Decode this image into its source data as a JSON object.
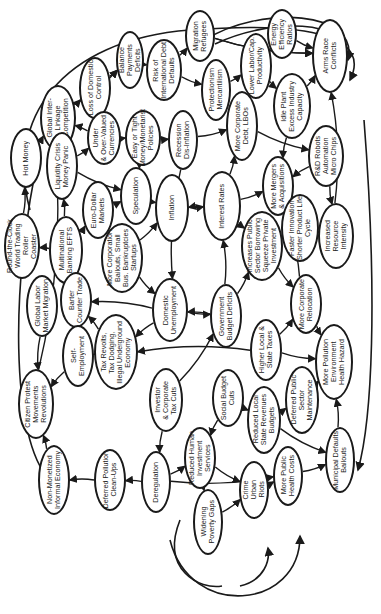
{
  "diagram": {
    "orientation": "rotated 90deg counter-clockwise (labels read bottom-to-top)",
    "colors": {
      "stroke": "#1a1a1a",
      "background": "#ffffff"
    },
    "nodes": [
      {
        "id": "n0",
        "label": "Global Inter-\nLinkage\nCompetition",
        "x": 58,
        "y": 118,
        "w": 36,
        "h": 66
      },
      {
        "id": "n1",
        "label": "Loss of Domestic\nControl",
        "x": 95,
        "y": 88,
        "w": 32,
        "h": 62
      },
      {
        "id": "n2",
        "label": "Balance\nPayments Deficits",
        "x": 130,
        "y": 60,
        "w": 28,
        "h": 58
      },
      {
        "id": "n3",
        "label": "Risk of\nInternational Debt\nDefaults",
        "x": 164,
        "y": 70,
        "w": 36,
        "h": 62
      },
      {
        "id": "n4",
        "label": "Migration\nRefugees",
        "x": 200,
        "y": 36,
        "w": 30,
        "h": 52
      },
      {
        "id": "n5",
        "label": "Protectionism\nMercantilism",
        "x": 216,
        "y": 90,
        "w": 30,
        "h": 62
      },
      {
        "id": "n6",
        "label": "Lower Labor/Cap.\nProductivity",
        "x": 256,
        "y": 66,
        "w": 32,
        "h": 66
      },
      {
        "id": "n7",
        "label": "Energy\nEfficiency\nRatios",
        "x": 282,
        "y": 34,
        "w": 30,
        "h": 50
      },
      {
        "id": "n8",
        "label": "Arms Race\nConflicts",
        "x": 330,
        "y": 56,
        "w": 36,
        "h": 74
      },
      {
        "id": "n9",
        "label": "Idle Plant\nExcess Industry\nCapacity",
        "x": 292,
        "y": 106,
        "w": 38,
        "h": 66
      },
      {
        "id": "n10",
        "label": "Under\n& Over-Valued\nCurrencies",
        "x": 104,
        "y": 138,
        "w": 34,
        "h": 54
      },
      {
        "id": "n11",
        "label": "Easy or Tight\nMoney/Monetarist\nPolicies",
        "x": 143,
        "y": 138,
        "w": 36,
        "h": 56
      },
      {
        "id": "n12",
        "label": "Recession\nDis-Inflation",
        "x": 183,
        "y": 140,
        "w": 30,
        "h": 60
      },
      {
        "id": "n13",
        "label": "More Corporate\nDebt, LBOs",
        "x": 242,
        "y": 126,
        "w": 32,
        "h": 70
      },
      {
        "id": "n14",
        "label": "R&D Robots\nAutomation\nMicro Chips",
        "x": 326,
        "y": 156,
        "w": 36,
        "h": 62
      },
      {
        "id": "n15",
        "label": "Hot Money",
        "x": 26,
        "y": 158,
        "w": 32,
        "h": 60
      },
      {
        "id": "n16",
        "label": "Liquidity Crisis\nMoney Panic",
        "x": 62,
        "y": 166,
        "w": 32,
        "h": 68
      },
      {
        "id": "n17",
        "label": "Euro-Dollar\nMarkets",
        "x": 98,
        "y": 210,
        "w": 32,
        "h": 58
      },
      {
        "id": "n18",
        "label": "Speculation",
        "x": 136,
        "y": 196,
        "w": 32,
        "h": 58
      },
      {
        "id": "n19",
        "label": "Inflation",
        "x": 172,
        "y": 208,
        "w": 34,
        "h": 68
      },
      {
        "id": "n20",
        "label": "Interest Rates",
        "x": 222,
        "y": 206,
        "w": 38,
        "h": 70
      },
      {
        "id": "n21",
        "label": "More Mergers\n& Acquisitions",
        "x": 278,
        "y": 186,
        "w": 32,
        "h": 60
      },
      {
        "id": "n22",
        "label": "Faster Innovation\nShorter Product Life\nCycle",
        "x": 300,
        "y": 228,
        "w": 38,
        "h": 68
      },
      {
        "id": "n23",
        "label": "Increased\nResource\nIntensity",
        "x": 336,
        "y": 236,
        "w": 36,
        "h": 66
      },
      {
        "id": "n24",
        "label": "Round-the-Clock\nWorld Trading Roller\nCoaster",
        "x": 22,
        "y": 246,
        "w": 36,
        "h": 66
      },
      {
        "id": "n25",
        "label": "Multinational\nBanking EFTS",
        "x": 66,
        "y": 250,
        "w": 34,
        "h": 68
      },
      {
        "id": "n26",
        "label": "More Corporation\nBailouts, Small\nBus. Bankruptcies\nStartups",
        "x": 122,
        "y": 258,
        "w": 42,
        "h": 70
      },
      {
        "id": "n27",
        "label": "Increases Public\nSector Borrowing\nSqueeze Private\nInvestment",
        "x": 262,
        "y": 246,
        "w": 42,
        "h": 70
      },
      {
        "id": "n28",
        "label": "Global Labor\nMarket Migration",
        "x": 42,
        "y": 306,
        "w": 32,
        "h": 62
      },
      {
        "id": "n29",
        "label": "Barter\nCounter Trade",
        "x": 76,
        "y": 300,
        "w": 32,
        "h": 56
      },
      {
        "id": "n30",
        "label": "Domestic\nUnemployment",
        "x": 170,
        "y": 310,
        "w": 36,
        "h": 64
      },
      {
        "id": "n31",
        "label": "Government\nBudget Deficits",
        "x": 226,
        "y": 316,
        "w": 32,
        "h": 64
      },
      {
        "id": "n32",
        "label": "More Corporate\nRelocation",
        "x": 306,
        "y": 304,
        "w": 32,
        "h": 60
      },
      {
        "id": "n33",
        "label": "Self-\nEmployment",
        "x": 78,
        "y": 356,
        "w": 32,
        "h": 62
      },
      {
        "id": "n34",
        "label": "Tax Revolts,\nTax Dodging,\nIllegal Underground\nEconomy",
        "x": 116,
        "y": 352,
        "w": 44,
        "h": 76
      },
      {
        "id": "n35",
        "label": "Higher Local &\nState Taxes",
        "x": 266,
        "y": 350,
        "w": 32,
        "h": 62
      },
      {
        "id": "n36",
        "label": "More Pollution\nEnvironment\nHealth Hazard",
        "x": 334,
        "y": 362,
        "w": 38,
        "h": 76
      },
      {
        "id": "n37",
        "label": "Citizen Protest\nMovements\nRevolutions",
        "x": 36,
        "y": 404,
        "w": 36,
        "h": 70
      },
      {
        "id": "n38",
        "label": "Investor\n& Corporate\nTax Cuts",
        "x": 166,
        "y": 400,
        "w": 34,
        "h": 64
      },
      {
        "id": "n39",
        "label": "Social Budget\nCuts",
        "x": 228,
        "y": 398,
        "w": 32,
        "h": 58
      },
      {
        "id": "n40",
        "label": "Deferred Public\nSector\nMaintenance",
        "x": 302,
        "y": 400,
        "w": 34,
        "h": 68
      },
      {
        "id": "n41",
        "label": "Reduced Local\nState Revenues\nBudgets",
        "x": 264,
        "y": 420,
        "w": 34,
        "h": 68
      },
      {
        "id": "n42",
        "label": "Non-Monetized\nInformal Economy",
        "x": 54,
        "y": 480,
        "w": 32,
        "h": 70
      },
      {
        "id": "n43",
        "label": "Deferred Pollution\nClean-Ups",
        "x": 110,
        "y": 480,
        "w": 32,
        "h": 62
      },
      {
        "id": "n44",
        "label": "Deregulation",
        "x": 156,
        "y": 482,
        "w": 30,
        "h": 62
      },
      {
        "id": "n45",
        "label": "Reduced Human\nInvestment\nServices",
        "x": 200,
        "y": 458,
        "w": 32,
        "h": 62
      },
      {
        "id": "n46",
        "label": "Crime\nUrban\nRiots",
        "x": 254,
        "y": 490,
        "w": 30,
        "h": 58
      },
      {
        "id": "n47",
        "label": "More Public\nHealth Costs",
        "x": 288,
        "y": 476,
        "w": 30,
        "h": 60
      },
      {
        "id": "n48",
        "label": "Municipal Defaults\nBailouts",
        "x": 340,
        "y": 460,
        "w": 30,
        "h": 66
      },
      {
        "id": "n49",
        "label": "Widening\nPoverty Gaps",
        "x": 208,
        "y": 522,
        "w": 30,
        "h": 66
      }
    ],
    "edges": [
      [
        "n0",
        "n1"
      ],
      [
        "n1",
        "n2"
      ],
      [
        "n2",
        "n3"
      ],
      [
        "n3",
        "n4"
      ],
      [
        "n4",
        "n8"
      ],
      [
        "n7",
        "n8"
      ],
      [
        "n6",
        "n7"
      ],
      [
        "n5",
        "n6"
      ],
      [
        "n3",
        "n5"
      ],
      [
        "n9",
        "n8"
      ],
      [
        "n6",
        "n9"
      ],
      [
        "n10",
        "n11"
      ],
      [
        "n11",
        "n12"
      ],
      [
        "n12",
        "n13"
      ],
      [
        "n13",
        "n14"
      ],
      [
        "n14",
        "n23"
      ],
      [
        "n14",
        "n21"
      ],
      [
        "n21",
        "n22"
      ],
      [
        "n22",
        "n23"
      ],
      [
        "n9",
        "n21"
      ],
      [
        "n15",
        "n0"
      ],
      [
        "n16",
        "n18"
      ],
      [
        "n17",
        "n18"
      ],
      [
        "n18",
        "n19"
      ],
      [
        "n19",
        "n20"
      ],
      [
        "n20",
        "n19"
      ],
      [
        "n20",
        "n21"
      ],
      [
        "n20",
        "n13"
      ],
      [
        "n20",
        "n27"
      ],
      [
        "n24",
        "n15"
      ],
      [
        "n25",
        "n24"
      ],
      [
        "n25",
        "n16"
      ],
      [
        "n25",
        "n17"
      ],
      [
        "n26",
        "n19"
      ],
      [
        "n26",
        "n30"
      ],
      [
        "n28",
        "n37"
      ],
      [
        "n29",
        "n25"
      ],
      [
        "n30",
        "n29"
      ],
      [
        "n30",
        "n31"
      ],
      [
        "n31",
        "n30"
      ],
      [
        "n31",
        "n20"
      ],
      [
        "n31",
        "n27"
      ],
      [
        "n32",
        "n36"
      ],
      [
        "n33",
        "n37"
      ],
      [
        "n34",
        "n33"
      ],
      [
        "n34",
        "n29"
      ],
      [
        "n35",
        "n36"
      ],
      [
        "n35",
        "n34"
      ],
      [
        "n38",
        "n31"
      ],
      [
        "n39",
        "n41"
      ],
      [
        "n40",
        "n36"
      ],
      [
        "n41",
        "n40"
      ],
      [
        "n41",
        "n48"
      ],
      [
        "n42",
        "n37"
      ],
      [
        "n43",
        "n42"
      ],
      [
        "n44",
        "n43"
      ],
      [
        "n44",
        "n45"
      ],
      [
        "n45",
        "n46"
      ],
      [
        "n45",
        "n49"
      ],
      [
        "n49",
        "n46"
      ],
      [
        "n46",
        "n47"
      ],
      [
        "n47",
        "n48"
      ],
      [
        "n48",
        "n36"
      ],
      [
        "n44",
        "n47"
      ],
      [
        "n12",
        "n30"
      ],
      [
        "n11",
        "n18"
      ],
      [
        "n10",
        "n0"
      ],
      [
        "n16",
        "n10"
      ],
      [
        "n27",
        "n32"
      ],
      [
        "n32",
        "n21"
      ],
      [
        "n23",
        "n8"
      ],
      [
        "n37",
        "n0"
      ],
      [
        "n0",
        "n2"
      ],
      [
        "n4",
        "n8"
      ],
      [
        "n39",
        "n45"
      ],
      [
        "n38",
        "n44"
      ],
      [
        "n30",
        "n34"
      ],
      [
        "n35",
        "n32"
      ]
    ]
  }
}
